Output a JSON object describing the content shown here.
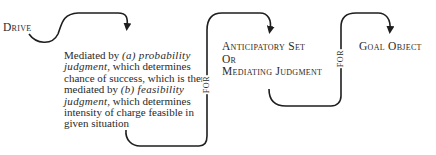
{
  "diagram": {
    "nodes": {
      "drive": "Drive",
      "mediation": {
        "t1": "Mediated by ",
        "t2": "(a) ",
        "t3": "probability judgment",
        "t4": ", which determines chance of success, which is then mediated by ",
        "t5": "(b) ",
        "t6": "feasibility judgment",
        "t7": ", which determines intensity of charge feasible in given situation"
      },
      "anticipatory": {
        "line1": "Anticipatory Set",
        "line2": "Or",
        "line3": "Mediating Judgment"
      },
      "goal": "Goal Object"
    },
    "connectors": {
      "for1": "FOR",
      "for2": "FOR"
    },
    "colors": {
      "stroke": "#1e1e1e",
      "text": "#2a2a2a",
      "background": "#ffffff"
    }
  }
}
